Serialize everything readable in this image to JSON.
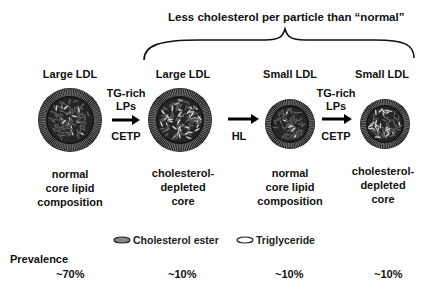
{
  "header": {
    "bracket_label": "Less cholesterol per particle than “normal”"
  },
  "particles": [
    {
      "title": "Large LDL",
      "description": [
        "normal",
        "core lipid",
        "composition"
      ],
      "prevalence": "~70%",
      "size": "large",
      "core": "normal"
    },
    {
      "title": "Large LDL",
      "description": [
        "cholesterol-",
        "depleted",
        "core"
      ],
      "prevalence": "~10%",
      "size": "large",
      "core": "cholesterol-depleted"
    },
    {
      "title": "Small LDL",
      "description": [
        "normal",
        "core lipid",
        "composition"
      ],
      "prevalence": "~10%",
      "size": "small",
      "core": "normal"
    },
    {
      "title": "Small LDL",
      "description": [
        "cholesterol-",
        "depleted",
        "core"
      ],
      "prevalence": "~10%",
      "size": "small",
      "core": "cholesterol-depleted"
    }
  ],
  "transitions": [
    {
      "above": [
        "TG-rich",
        "LPs"
      ],
      "below": "CETP"
    },
    {
      "above": [],
      "below": "HL"
    },
    {
      "above": [
        "TG-rich",
        "LPs"
      ],
      "below": "CETP"
    }
  ],
  "legend": {
    "items": [
      {
        "label": "Cholesterol ester",
        "icon": "filled-gray-ellipse",
        "color": "#888888"
      },
      {
        "label": "Triglyceride",
        "icon": "open-white-ellipse",
        "color": "#ffffff"
      }
    ]
  },
  "prevalence": {
    "label": "Prevalence"
  },
  "colors": {
    "shell": "#1a1a1a",
    "core": "#2a2a2a",
    "arrow": "#000000"
  }
}
